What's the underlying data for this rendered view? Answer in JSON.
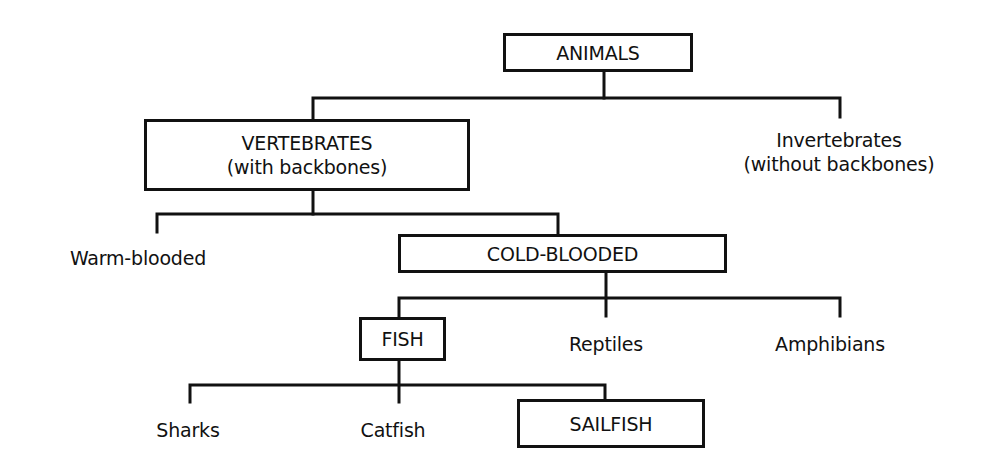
{
  "diagram": {
    "type": "classification-tree",
    "colors": {
      "line": "#111111",
      "background": "#ffffff",
      "text": "#111111"
    },
    "nodes": {
      "animals": {
        "label": "ANIMALS",
        "boxed": true
      },
      "vertebrates": {
        "line1": "VERTEBRATES",
        "line2": "(with backbones)",
        "boxed": true
      },
      "invertebrates": {
        "line1": "Invertebrates",
        "line2": "(without backbones)",
        "boxed": false
      },
      "warm_blooded": {
        "label": "Warm-blooded",
        "boxed": false
      },
      "cold_blooded": {
        "label": "COLD-BLOODED",
        "boxed": true
      },
      "fish": {
        "label": "FISH",
        "boxed": true
      },
      "reptiles": {
        "label": "Reptiles",
        "boxed": false
      },
      "amphibians": {
        "label": "Amphibians",
        "boxed": false
      },
      "sharks": {
        "label": "Sharks",
        "boxed": false
      },
      "catfish": {
        "label": "Catfish",
        "boxed": false
      },
      "sailfish": {
        "label": "SAILFISH",
        "boxed": true
      }
    },
    "edges": [
      [
        "ANIMALS",
        "VERTEBRATES"
      ],
      [
        "ANIMALS",
        "Invertebrates"
      ],
      [
        "VERTEBRATES",
        "Warm-blooded"
      ],
      [
        "VERTEBRATES",
        "COLD-BLOODED"
      ],
      [
        "COLD-BLOODED",
        "FISH"
      ],
      [
        "COLD-BLOODED",
        "Reptiles"
      ],
      [
        "COLD-BLOODED",
        "Amphibians"
      ],
      [
        "FISH",
        "Sharks"
      ],
      [
        "FISH",
        "Catfish"
      ],
      [
        "FISH",
        "SAILFISH"
      ]
    ]
  }
}
